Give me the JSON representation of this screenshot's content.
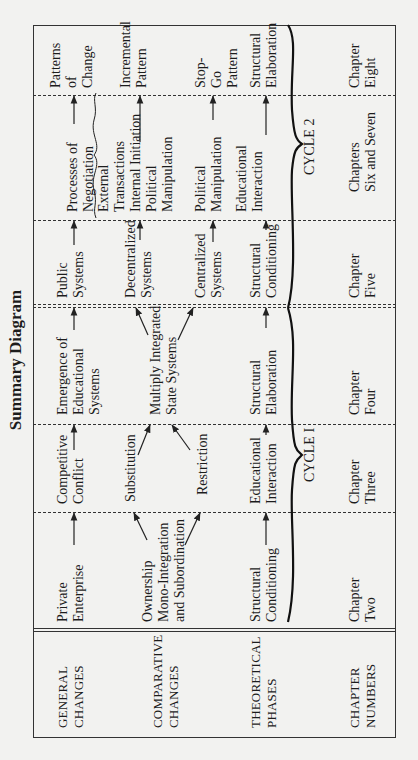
{
  "title": "Summary Diagram",
  "row_headers": [
    {
      "line1": "GENERAL",
      "line2": "CHANGES"
    },
    {
      "line1": "COMPARATIVE",
      "line2": "CHANGES"
    },
    {
      "line1": "THEORETICAL",
      "line2": "PHASES"
    },
    {
      "line1": "CHAPTER",
      "line2": "NUMBERS"
    }
  ],
  "general_changes": {
    "c1": [
      "Private",
      "Enterprise"
    ],
    "c2": [
      "Competitive",
      "Conflict"
    ],
    "c3": [
      "Emergence of",
      "Educational",
      "Systems"
    ],
    "c4": [
      "Public",
      "Systems"
    ],
    "c5": [
      "Processes of",
      "Negotiation"
    ],
    "c6": [
      "Patterns",
      "of",
      "Change"
    ]
  },
  "comparative_changes": {
    "c1": [
      "Ownership",
      "Mono-Integration",
      "and Subordination"
    ],
    "c2_top": "Substitution",
    "c2_bottom": "Restriction",
    "c3": [
      "Multiply Integrated",
      "State Systems"
    ],
    "c4_top": [
      "Decentralized",
      "Systems"
    ],
    "c4_bottom": [
      "Centralized",
      "Systems"
    ],
    "c5_top": [
      "External",
      "Transactions",
      "Internal Initiation",
      "Political",
      "Manipulation"
    ],
    "c5_bottom": [
      "Political",
      "Manipulation"
    ],
    "c6_top": [
      "Incremental",
      "Pattern"
    ],
    "c6_bottom": [
      "Stop-",
      "Go",
      "Pattern"
    ]
  },
  "theoretical_phases": {
    "c1": [
      "Structural",
      "Conditioning"
    ],
    "c2": [
      "Educational",
      "Interaction"
    ],
    "c3": [
      "Structural",
      "Elaboration"
    ],
    "c4": [
      "Structural",
      "Conditioning"
    ],
    "c5": [
      "Educational",
      "Interaction"
    ],
    "c6": [
      "Structural",
      "Elaboration"
    ],
    "cycle1": "CYCLE I",
    "cycle2": "CYCLE 2"
  },
  "chapter_numbers": {
    "c1": [
      "Chapter",
      "Two"
    ],
    "c2": [
      "Chapter",
      "Three"
    ],
    "c3": [
      "Chapter",
      "Four"
    ],
    "c4": [
      "Chapter",
      "Five"
    ],
    "c5": [
      "Chapters",
      "Six and Seven"
    ],
    "c6": [
      "Chapter",
      "Eight"
    ]
  }
}
